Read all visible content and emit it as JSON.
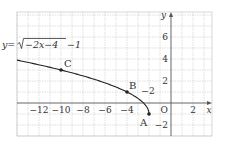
{
  "chart_data": {
    "type": "line",
    "title": "",
    "equation_label": "y=√(−2x−4)−1",
    "equation_parts": {
      "lhs": "y=",
      "radicand": "−2x−4",
      "tail": "−1"
    },
    "xlabel": "x",
    "ylabel": "y",
    "origin_label": "O",
    "xlim": [
      -14.1,
      3.7
    ],
    "ylim": [
      -3,
      8.2
    ],
    "grid": true,
    "grid_step": 1,
    "x_ticks": [
      {
        "value": -12,
        "label": "−12"
      },
      {
        "value": -10,
        "label": "−10"
      },
      {
        "value": -8,
        "label": "−8"
      },
      {
        "value": -6,
        "label": "−6"
      },
      {
        "value": -4,
        "label": "−4"
      },
      {
        "value": -2,
        "label": "−2"
      },
      {
        "value": 2,
        "label": "2"
      }
    ],
    "y_ticks": [
      {
        "value": 6,
        "label": "6"
      },
      {
        "value": 4,
        "label": "4"
      },
      {
        "value": 2,
        "label": "2"
      },
      {
        "value": -2,
        "label": "−2"
      }
    ],
    "series": [
      {
        "name": "y=√(−2x−4)−1",
        "function": "sqrt(-2x-4)-1",
        "domain": [
          -14.1,
          -2
        ],
        "x": [
          -14,
          -12,
          -10,
          -8,
          -6,
          -4,
          -3,
          -2.5,
          -2
        ],
        "values": [
          3.9,
          3.47,
          3.0,
          2.46,
          1.83,
          1.0,
          0.41,
          0.0,
          -1.0
        ]
      }
    ],
    "points": [
      {
        "label": "A",
        "x": -2,
        "y": -1
      },
      {
        "label": "B",
        "x": -4,
        "y": 1
      },
      {
        "label": "C",
        "x": -10,
        "y": 3
      }
    ],
    "legend": null
  },
  "colors": {
    "curve": "#222222",
    "axis": "#555555",
    "grid": "#bdbdbd",
    "text": "#333333"
  }
}
